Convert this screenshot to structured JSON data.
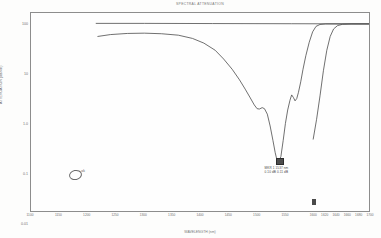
{
  "chart": {
    "title": "SPECTRAL ATTENUATION",
    "xlabel": "WAVELENGTH (nm)",
    "ylabel": "ATTENUATION (dB/km)"
  },
  "chart_data": {
    "type": "line",
    "title": "SPECTRAL ATTENUATION",
    "xlabel": "WAVELENGTH (nm)",
    "ylabel": "ATTENUATION (dB/km)",
    "xscale": "linear",
    "yscale": "log",
    "grid": true,
    "legend": "none",
    "xlim": [
      1100,
      1700
    ],
    "ylim": [
      0.01,
      100
    ],
    "xticks": [
      1100,
      1150,
      1200,
      1250,
      1300,
      1350,
      1400,
      1450,
      1500,
      1550,
      1600,
      1620,
      1640,
      1660,
      1680,
      1700
    ],
    "xtick_labels": [
      "1100",
      "1150",
      "1200",
      "1250",
      "1300",
      "1350",
      "1400",
      "1450",
      "1500",
      "1550",
      "1600",
      "1620",
      "1640",
      "1660",
      "1680",
      "1700"
    ],
    "yticks": [
      0.01,
      0.02,
      0.05,
      0.1,
      0.2,
      0.5,
      1,
      2,
      5,
      10,
      20,
      50,
      100
    ],
    "ytick_labels": [
      "0.01",
      "0.02",
      "0.05",
      "0.1",
      "0.2",
      "0.5",
      "1",
      "2",
      "5",
      "10",
      "20",
      "50",
      "100"
    ],
    "ytick_major": [
      0.01,
      0.1,
      1,
      10,
      100
    ],
    "ytick_major_labels": [
      "0.01",
      "0.1",
      "1.0",
      "10",
      "100"
    ],
    "series": [
      {
        "name": "reference-baseline",
        "style": "flat-line",
        "points": [
          [
            1215,
            62.0
          ],
          [
            1300,
            62.0
          ],
          [
            1420,
            61.5
          ],
          [
            1560,
            61.0
          ],
          [
            1700,
            60.5
          ]
        ]
      },
      {
        "name": "attenuation-curve",
        "style": "measured",
        "points": [
          [
            1218,
            34.0
          ],
          [
            1240,
            37.0
          ],
          [
            1270,
            39.0
          ],
          [
            1300,
            39.5
          ],
          [
            1330,
            38.5
          ],
          [
            1360,
            36.0
          ],
          [
            1385,
            31.0
          ],
          [
            1405,
            25.0
          ],
          [
            1425,
            18.0
          ],
          [
            1440,
            12.0
          ],
          [
            1455,
            7.5
          ],
          [
            1468,
            4.6
          ],
          [
            1478,
            3.0
          ],
          [
            1487,
            2.0
          ],
          [
            1494,
            1.45
          ],
          [
            1499,
            1.22
          ],
          [
            1503,
            1.2
          ],
          [
            1508,
            1.28
          ],
          [
            1512,
            1.22
          ],
          [
            1517,
            0.95
          ],
          [
            1522,
            0.55
          ],
          [
            1527,
            0.28
          ],
          [
            1531,
            0.16
          ],
          [
            1534,
            0.115
          ],
          [
            1537,
            0.105
          ],
          [
            1541,
            0.135
          ],
          [
            1545,
            0.28
          ],
          [
            1549,
            0.62
          ],
          [
            1553,
            1.15
          ],
          [
            1557,
            1.8
          ],
          [
            1560,
            2.3
          ],
          [
            1563,
            2.05
          ],
          [
            1566,
            1.75
          ],
          [
            1569,
            1.95
          ],
          [
            1572,
            2.6
          ],
          [
            1576,
            4.2
          ],
          [
            1580,
            7.5
          ],
          [
            1585,
            14.0
          ],
          [
            1591,
            26.0
          ],
          [
            1597,
            42.0
          ],
          [
            1603,
            54.0
          ],
          [
            1610,
            59.0
          ],
          [
            1620,
            60.5
          ],
          [
            1650,
            60.5
          ],
          [
            1700,
            60.5
          ]
        ]
      },
      {
        "name": "secondary-rise",
        "style": "measured",
        "points": [
          [
            1598,
            0.3
          ],
          [
            1604,
            0.75
          ],
          [
            1610,
            2.2
          ],
          [
            1616,
            7.0
          ],
          [
            1622,
            18.0
          ],
          [
            1628,
            34.0
          ],
          [
            1634,
            48.0
          ],
          [
            1641,
            56.0
          ],
          [
            1650,
            59.5
          ],
          [
            1665,
            60.5
          ],
          [
            1700,
            60.5
          ]
        ]
      }
    ],
    "annotations": [
      {
        "name": "cursor-readout",
        "lines": [
          "MKR 1    1537 nm",
          "0.10 dB    0.11 dB"
        ],
        "x": 1537,
        "y": 0.11
      },
      {
        "name": "handwritten-note",
        "text": "ok",
        "x": 1180,
        "y": 0.06
      }
    ]
  },
  "readout": {
    "line1": "MKR 1     1537 nm",
    "line2": "0.10 dB    0.11 dB"
  },
  "hand_note": {
    "text": "ok"
  },
  "colors": {
    "grid_minor": "#c9c9c9",
    "grid_major": "#8a8a8a",
    "trace": "#4b4b4b",
    "background": "#fefefe"
  }
}
